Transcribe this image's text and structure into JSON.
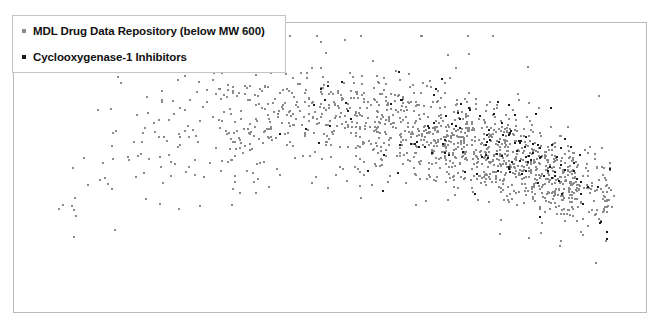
{
  "chart_data": {
    "type": "scatter",
    "title": "",
    "xlabel": "",
    "ylabel": "",
    "grid": false,
    "legend_position": "top-left",
    "xlim": [
      0,
      1
    ],
    "ylim": [
      0,
      1
    ],
    "axes": {
      "ticks_visible": false,
      "tick_labels": [],
      "frame": "box"
    },
    "series": [
      {
        "name": "MDL Drug Data Repository (below MW 600)",
        "color": "#8a8a8a",
        "marker": "square",
        "marker_size": 2,
        "point_count": 1400,
        "distribution": {
          "shape": "down-sloping dense band widening to the right, tapering at far right edge",
          "x_range": [
            0.02,
            0.96
          ],
          "y_range": [
            0.04,
            0.96
          ],
          "density_peak_x": 0.78,
          "density_peak_y": 0.42
        }
      },
      {
        "name": "Cyclooxygenase-1 Inhibitors",
        "color": "#1c1c1c",
        "marker": "square",
        "marker_size": 2,
        "point_count": 130,
        "distribution": {
          "shape": "overlaid on the dense right-central region of the background set",
          "x_range": [
            0.3,
            0.95
          ],
          "y_range": [
            0.1,
            0.8
          ],
          "density_peak_x": 0.8,
          "density_peak_y": 0.45
        }
      }
    ]
  },
  "legend": {
    "entries": [
      {
        "label": "MDL Drug Data Repository (below MW 600)",
        "swatch_color": "#8a8a8a"
      },
      {
        "label": "Cyclooxygenase-1 Inhibitors",
        "swatch_color": "#1c1c1c"
      }
    ]
  },
  "colors": {
    "background": "#ffffff",
    "plot_border": "#b9b9b9",
    "legend_border": "#c4c4c4",
    "series_1": "#8a8a8a",
    "series_2": "#1c1c1c",
    "text": "#111111"
  }
}
